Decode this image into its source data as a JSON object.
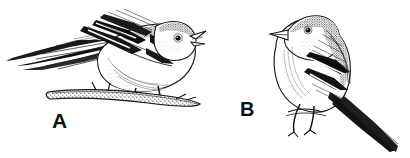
{
  "figure": {
    "kind": "scientific-ink-illustration",
    "background_color": "#ffffff",
    "ink_color": "#111111",
    "width_px": 410,
    "height_px": 158,
    "panels": [
      {
        "id": "a",
        "label": "A",
        "caption_position": "below-left-of-bird",
        "pose": "crouched horizontal on branch, head raised, beak open singing, facing right",
        "tail_direction": "left, long and streaked",
        "perch": "thick horizontal lichen-textured branch",
        "markings": "bold black-and-white wing bars, stippled crown and back, pale breast",
        "label_color": "#101010"
      },
      {
        "id": "b",
        "label": "B",
        "caption_position": "left-of-bird",
        "pose": "upright on thin twig, head turned left, beak closed, facing left",
        "tail_direction": "down and to the right, long and pointed",
        "perch": "thin twig gripped by two clawed feet",
        "markings": "bold black-and-white wing bars, stippled crown, pale speckled breast",
        "label_color": "#101010"
      }
    ]
  }
}
